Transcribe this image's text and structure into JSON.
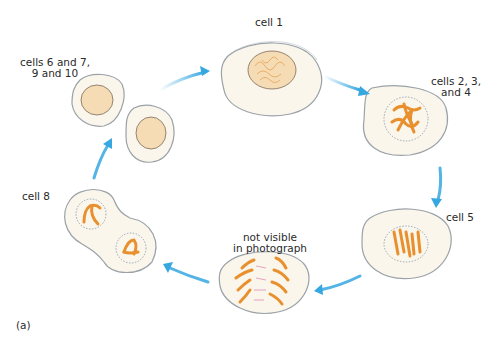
{
  "figure": {
    "panel_label": "(a)",
    "colors": {
      "cytoplasm": "#fbf6ec",
      "membrane": "#9aa2a8",
      "nucleus_fill": "#f6dcb4",
      "chromatin": "#e9a860",
      "chromosome": "#e8902e",
      "arrow": "#36a7e0",
      "spindle": "#d96aa0"
    },
    "stages": [
      {
        "id": "cell-1",
        "label": "cell 1",
        "description": "interphase nucleus with diffuse chromatin"
      },
      {
        "id": "cells-2-3-4",
        "label": "cells 2, 3,\nand 4",
        "description": "prophase with condensing chromosomes"
      },
      {
        "id": "cell-5",
        "label": "cell 5",
        "description": "metaphase chromosomes aligned"
      },
      {
        "id": "anaphase",
        "label": "not visible\nin photograph",
        "description": "anaphase chromosomes separating"
      },
      {
        "id": "cell-8",
        "label": "cell 8",
        "description": "telophase with two forming nuclei"
      },
      {
        "id": "cells-6-7-9-10",
        "label": "cells 6 and 7,\n9 and 10",
        "description": "two daughter cells in interphase"
      }
    ]
  }
}
